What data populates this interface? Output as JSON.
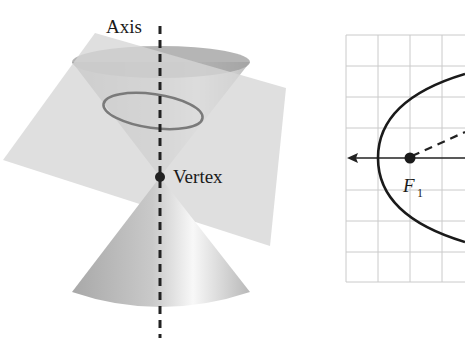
{
  "figure": {
    "cone_diagram": {
      "axis_label": "Axis",
      "vertex_label": "Vertex",
      "colors": {
        "axis": "#222222",
        "ellipse": "#777777",
        "plane": "#d8d8d8",
        "cone": "#b5b5b5"
      }
    },
    "graph": {
      "focus_label": "F",
      "focus_subscript": "1",
      "grid_color": "#c8c8c8",
      "curve_color": "#1a1a1a"
    }
  }
}
